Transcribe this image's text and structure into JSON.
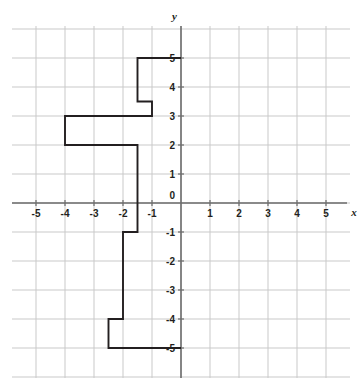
{
  "figure": {
    "partial_top_text": "· · ·",
    "axis_labels": {
      "x": "x",
      "y": "y"
    },
    "x_tick_labels": [
      "-5",
      "-4",
      "-3",
      "-2",
      "-1",
      "0",
      "1",
      "2",
      "3",
      "4",
      "5"
    ],
    "y_tick_labels": [
      "5",
      "4",
      "3",
      "2",
      "1",
      "0",
      "-1",
      "-2",
      "-3",
      "-4",
      "-5"
    ],
    "origin_label": "0",
    "colors": {
      "grid": "#c9c9c9",
      "axis": "#6d6d6d",
      "curve": "#231f20",
      "label": "#231f20",
      "background": "#ffffff"
    }
  },
  "chart_data": {
    "type": "line",
    "title": "",
    "xlabel": "x",
    "ylabel": "y",
    "xlim": [
      -5.8,
      5.8
    ],
    "ylim": [
      -5.8,
      5.8
    ],
    "xticks": [
      -5,
      -4,
      -3,
      -2,
      -1,
      0,
      1,
      2,
      3,
      4,
      5
    ],
    "yticks": [
      -5,
      -4,
      -3,
      -2,
      -1,
      0,
      1,
      2,
      3,
      4,
      5
    ],
    "grid": true,
    "legend": null,
    "series": [
      {
        "name": "step-path",
        "style": "step",
        "x": [
          0,
          -1.5,
          -1.5,
          -1,
          -1,
          -4,
          -4,
          -1.5,
          -1.5,
          -2,
          -2,
          -2.5,
          -2.5,
          0
        ],
        "y": [
          5,
          5,
          3.5,
          3.5,
          3,
          3,
          2,
          2,
          -1,
          -1,
          -4,
          -4,
          -5,
          -5
        ]
      }
    ],
    "vertices": [
      {
        "x": 0,
        "y": 5
      },
      {
        "x": -1.5,
        "y": 5
      },
      {
        "x": -1.5,
        "y": 3.5
      },
      {
        "x": -1,
        "y": 3.5
      },
      {
        "x": -1,
        "y": 3
      },
      {
        "x": -4,
        "y": 3
      },
      {
        "x": -4,
        "y": 2
      },
      {
        "x": -1.5,
        "y": 2
      },
      {
        "x": -1.5,
        "y": -1
      },
      {
        "x": -2,
        "y": -1
      },
      {
        "x": -2,
        "y": -4
      },
      {
        "x": -2.5,
        "y": -4
      },
      {
        "x": -2.5,
        "y": -5
      },
      {
        "x": 0,
        "y": -5
      }
    ]
  }
}
